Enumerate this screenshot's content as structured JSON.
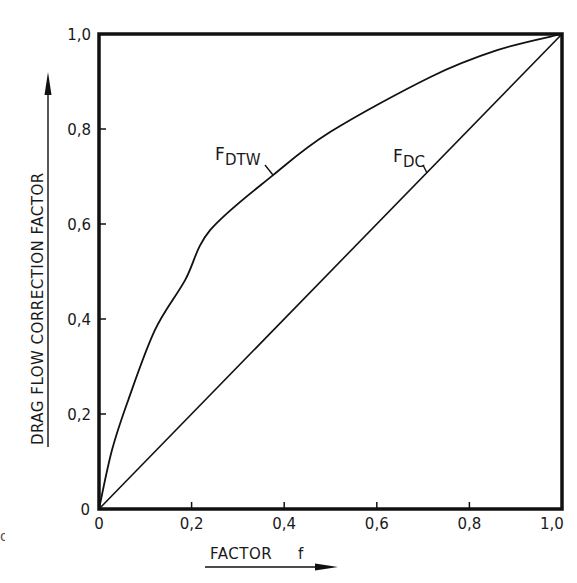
{
  "chart_data": {
    "type": "line",
    "title": "",
    "xlabel": "FACTOR f",
    "ylabel": "DRAG FLOW CORRECTION FACTOR",
    "xlim": [
      0,
      1.0
    ],
    "ylim": [
      0,
      1.0
    ],
    "grid": false,
    "legend": "none (curves labeled inline)",
    "x_ticks": [
      "0",
      "0.2",
      "0.4",
      "0.6",
      "0.8",
      "1.0"
    ],
    "y_ticks": [
      "0",
      "0.2",
      "0.4",
      "0.6",
      "0.8",
      "1.0"
    ],
    "series": [
      {
        "name": "F_DTW",
        "label_main": "F",
        "label_sub": "DTW",
        "x": [
          0,
          0.028,
          0.063,
          0.121,
          0.186,
          0.24,
          0.376,
          0.5,
          0.715,
          0.86,
          1.0
        ],
        "y": [
          0,
          0.124,
          0.229,
          0.377,
          0.482,
          0.587,
          0.703,
          0.794,
          0.909,
          0.966,
          1.0
        ]
      },
      {
        "name": "F_DC",
        "label_main": "F",
        "label_sub": "DC",
        "x": [
          0,
          1.0
        ],
        "y": [
          0,
          1.0
        ]
      }
    ]
  },
  "axes": {
    "x_title": "FACTOR",
    "x_title_symbol": "f",
    "y_title": "DRAG FLOW CORRECTION FACTOR"
  },
  "labels": {
    "x_ticks": [
      "0",
      "0,2",
      "0,4",
      "0,6",
      "0,8",
      "1,0"
    ],
    "y_ticks": [
      "0",
      "0,2",
      "0,4",
      "0,6",
      "0,8",
      "1,0"
    ],
    "curve_dtw_main": "F",
    "curve_dtw_sub": "DTW",
    "curve_dc_main": "F",
    "curve_dc_sub": "DC"
  },
  "artifact_glyph": "g"
}
